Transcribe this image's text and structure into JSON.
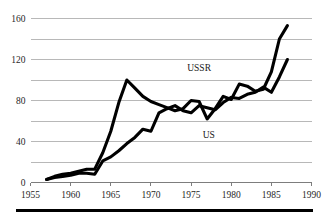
{
  "chart_data": {
    "type": "line",
    "title": "",
    "subtitle": "",
    "xlabel": "",
    "ylabel": "",
    "xlim": [
      1955,
      1990
    ],
    "ylim": [
      0,
      160
    ],
    "grid": "horizontal",
    "legend_position": "inline-annotation",
    "x_ticks": [
      "1955",
      "1960",
      "1965",
      "1970",
      "1975",
      "1980",
      "1985",
      "1990"
    ],
    "x_tick_values": [
      1955,
      1960,
      1965,
      1970,
      1975,
      1980,
      1985,
      1990
    ],
    "y_ticks": [
      "0",
      "40",
      "80",
      "120",
      "160"
    ],
    "y_tick_values": [
      0,
      40,
      80,
      120,
      160
    ],
    "y_gridline_values": [
      0,
      20,
      40,
      60,
      80,
      100,
      120,
      140,
      160
    ],
    "annotations": [
      {
        "text": "USSR",
        "x": 1976.0,
        "y": 112
      },
      {
        "text": "US",
        "x": 1977.2,
        "y": 47
      }
    ],
    "series": [
      {
        "name": "USSR",
        "color": "#000000",
        "x": [
          1957,
          1958,
          1959,
          1960,
          1961,
          1962,
          1963,
          1964,
          1965,
          1966,
          1967,
          1968,
          1969,
          1970,
          1971,
          1972,
          1973,
          1974,
          1975,
          1976,
          1977,
          1978,
          1979,
          1980,
          1981,
          1982,
          1983,
          1984,
          1985,
          1986,
          1987
        ],
        "values": [
          3,
          6,
          8,
          9,
          11,
          13,
          13,
          29,
          50,
          78,
          100,
          92,
          84,
          79,
          76,
          73,
          70,
          72,
          80,
          79,
          62,
          72,
          84,
          81,
          96,
          94,
          89,
          91,
          108,
          140,
          153
        ]
      },
      {
        "name": "US",
        "color": "#000000",
        "x": [
          1957,
          1958,
          1959,
          1960,
          1961,
          1962,
          1963,
          1964,
          1965,
          1966,
          1967,
          1968,
          1969,
          1970,
          1971,
          1972,
          1973,
          1974,
          1975,
          1976,
          1977,
          1978,
          1979,
          1980,
          1981,
          1982,
          1983,
          1984,
          1985,
          1986,
          1987
        ],
        "values": [
          3,
          5,
          6,
          7,
          9,
          9,
          8,
          21,
          25,
          31,
          38,
          44,
          52,
          50,
          68,
          72,
          75,
          70,
          68,
          75,
          73,
          71,
          78,
          83,
          82,
          86,
          88,
          93,
          88,
          103,
          120
        ]
      }
    ]
  },
  "labels": {
    "ussr": "USSR",
    "us": "US"
  }
}
